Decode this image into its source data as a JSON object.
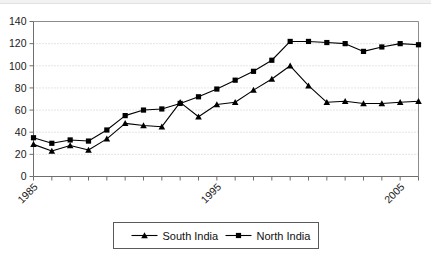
{
  "chart_data": {
    "type": "line",
    "title": "",
    "subtitle": "",
    "xlabel": "",
    "ylabel": "",
    "x": [
      1985,
      1986,
      1987,
      1988,
      1989,
      1990,
      1991,
      1992,
      1993,
      1994,
      1995,
      1996,
      1997,
      1998,
      1999,
      2000,
      2001,
      2002,
      2003,
      2004,
      2005,
      2006
    ],
    "xlim": [
      1985,
      2006
    ],
    "ylim": [
      0,
      140
    ],
    "ytick_values": [
      0,
      20,
      40,
      60,
      80,
      100,
      120,
      140
    ],
    "ytick_labels": [
      "0",
      "20",
      "40",
      "60",
      "80",
      "100",
      "120",
      "140"
    ],
    "xtick_labels_shown": [
      "1985",
      "1995",
      "2005"
    ],
    "xtick_label_years": [
      1985,
      1995,
      2005
    ],
    "grid": "horizontal-dotted",
    "legend_position": "bottom-center",
    "series": [
      {
        "name": "South India",
        "marker": "triangle",
        "color": "#000000",
        "values": [
          29,
          23,
          28,
          24,
          34,
          48,
          46,
          45,
          67,
          54,
          65,
          67,
          78,
          88,
          100,
          82,
          67,
          68,
          66,
          66,
          67,
          68
        ]
      },
      {
        "name": "North India",
        "marker": "square",
        "color": "#000000",
        "values": [
          35,
          30,
          33,
          32,
          42,
          55,
          60,
          61,
          66,
          72,
          79,
          87,
          95,
          105,
          122,
          122,
          121,
          120,
          113,
          117,
          120,
          119
        ]
      }
    ]
  },
  "legend": {
    "items": [
      {
        "label": "South India",
        "marker": "triangle"
      },
      {
        "label": "North India",
        "marker": "square"
      }
    ]
  },
  "axes": {
    "y_labels": [
      "140",
      "120",
      "100",
      "80",
      "60",
      "40",
      "20",
      "0"
    ],
    "x_labels": [
      "1985",
      "1995",
      "2005"
    ]
  }
}
